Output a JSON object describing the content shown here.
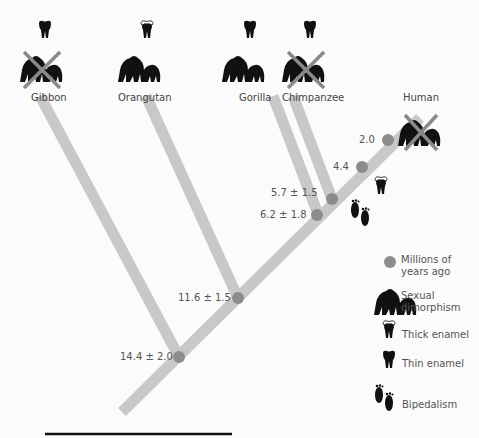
{
  "diagram": {
    "type": "phylogenetic-tree",
    "species": [
      {
        "name": "Gibbon",
        "enamel": "thin",
        "sexual_dimorphism": false
      },
      {
        "name": "Orangutan",
        "enamel": "thick",
        "sexual_dimorphism": true
      },
      {
        "name": "Gorilla",
        "enamel": "thin",
        "sexual_dimorphism": true
      },
      {
        "name": "Chimpanzee",
        "enamel": "thin",
        "sexual_dimorphism": false
      },
      {
        "name": "Human",
        "enamel": "thick",
        "sexual_dimorphism": false,
        "bipedalism": true
      }
    ],
    "nodes": [
      {
        "label": "14.4 ± 2.0"
      },
      {
        "label": "11.6 ± 1.5"
      },
      {
        "label": "6.2 ± 1.8"
      },
      {
        "label": "5.7 ± 1.5"
      },
      {
        "label": "4.4"
      },
      {
        "label": "2.0"
      }
    ],
    "legend": [
      {
        "icon": "node-dot-icon",
        "label": "Millions of years ago"
      },
      {
        "icon": "gorilla-pair-icon",
        "label": "Sexual dimorphism"
      },
      {
        "icon": "thick-enamel-tooth-icon",
        "label": "Thick enamel"
      },
      {
        "icon": "thin-enamel-tooth-icon",
        "label": "Thin enamel"
      },
      {
        "icon": "footprints-icon",
        "label": "Bipedalism"
      }
    ],
    "colors": {
      "branch": "#c8c8c8",
      "node": "#8c8c8c",
      "cross": "#8a8a8a",
      "icon": "#111111"
    }
  }
}
